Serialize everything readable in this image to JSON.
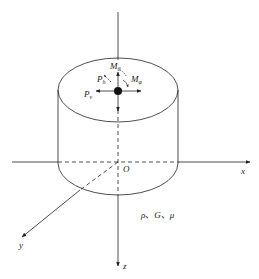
{
  "diagram": {
    "type": "cylinder-foundation-coordinate-system",
    "axes": {
      "x_label": "x",
      "y_label": "y",
      "z_label": "z",
      "origin_label": "O"
    },
    "loads": {
      "M_theta": {
        "base": "M",
        "sub": "θ"
      },
      "M_phi": {
        "base": "M",
        "sub": "φ"
      },
      "P_h": {
        "base": "P",
        "sub": "h"
      },
      "P_v": {
        "base": "P",
        "sub": "v"
      }
    },
    "material_label": "ρ、G、μ",
    "colors": {
      "line": "#222222",
      "background": "#ffffff"
    }
  }
}
